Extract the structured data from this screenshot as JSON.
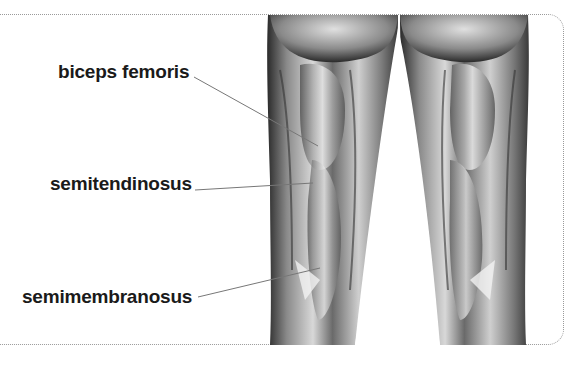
{
  "figure": {
    "border_color": "#9a9a9a",
    "labels": [
      {
        "text": "biceps femoris",
        "x": 58,
        "y": 62,
        "line": {
          "x1": 194,
          "y1": 77,
          "x2": 318,
          "y2": 146
        }
      },
      {
        "text": "semitendinosus",
        "x": 50,
        "y": 174,
        "line": {
          "x1": 195,
          "y1": 190,
          "x2": 313,
          "y2": 183
        }
      },
      {
        "text": "semimembranosus",
        "x": 22,
        "y": 287,
        "line": {
          "x1": 198,
          "y1": 297,
          "x2": 320,
          "y2": 268
        }
      }
    ]
  }
}
